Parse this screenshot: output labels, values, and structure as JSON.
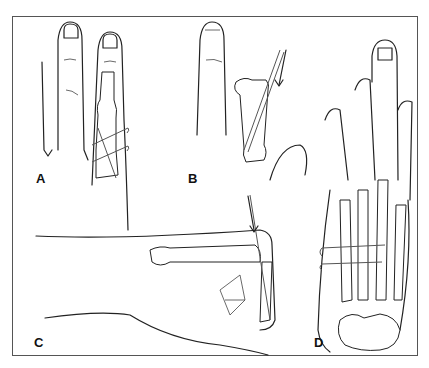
{
  "figure": {
    "panels": [
      {
        "label": "A",
        "description": "Dorsal view of finger with phalanx fracture fixed by two crossed K-wires"
      },
      {
        "label": "B",
        "description": "Finger with displaced proximal phalanx fracture and wire inserted along arrow direction"
      },
      {
        "label": "C",
        "description": "Lateral view of hand with flexed finger and longitudinal wire inserted through knuckle along arrow"
      },
      {
        "label": "D",
        "description": "Dorsal view of hand with metacarpal fractures fixed by two transverse wires"
      }
    ]
  }
}
